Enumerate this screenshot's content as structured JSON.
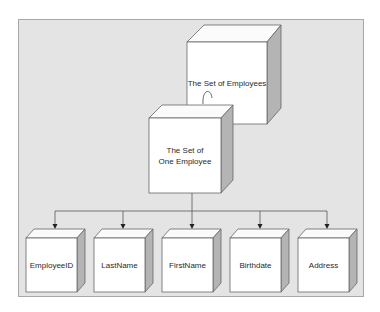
{
  "diagram": {
    "type": "hierarchy",
    "colors": {
      "panel_bg": "#e4e4e4",
      "panel_border": "#a8a8a8",
      "cube_front": "#ffffff",
      "cube_top": "#fbfbfb",
      "cube_side": "#b4b4b4",
      "line": "#555555"
    },
    "nodes": {
      "set_of_employees": {
        "label": "The Set of Employees"
      },
      "set_of_one_employee": {
        "label_line1": "The Set of",
        "label_line2": "One Employee"
      },
      "attributes": [
        {
          "label": "EmployeeID"
        },
        {
          "label": "LastName"
        },
        {
          "label": "FirstName"
        },
        {
          "label": "Birthdate"
        },
        {
          "label": "Address"
        }
      ]
    },
    "edges": [
      {
        "from": "set_of_employees",
        "to": "set_of_one_employee",
        "style": "curved-arrow"
      },
      {
        "from": "set_of_one_employee",
        "to": "EmployeeID"
      },
      {
        "from": "set_of_one_employee",
        "to": "LastName"
      },
      {
        "from": "set_of_one_employee",
        "to": "FirstName"
      },
      {
        "from": "set_of_one_employee",
        "to": "Birthdate"
      },
      {
        "from": "set_of_one_employee",
        "to": "Address"
      }
    ]
  }
}
